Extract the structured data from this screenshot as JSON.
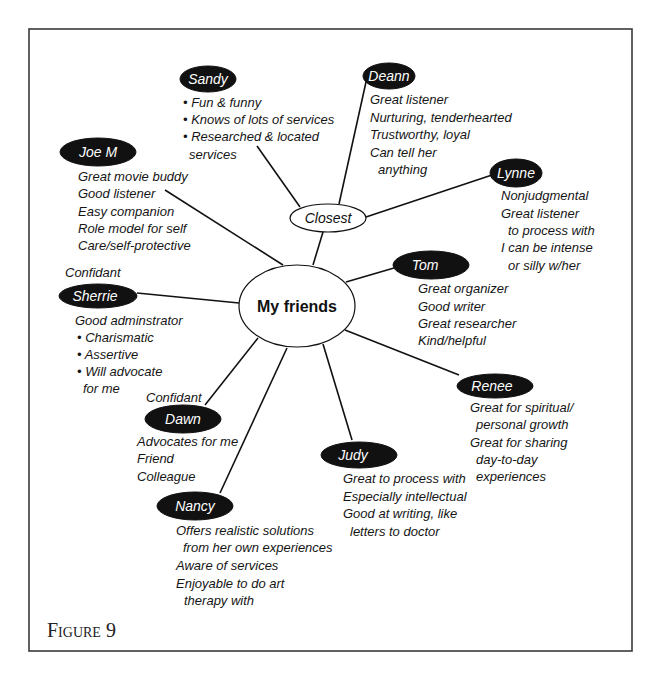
{
  "diagram": {
    "center": {
      "label": "My friends"
    },
    "hub": {
      "label": "Closest"
    },
    "caption": "Figure 9",
    "colors": {
      "node_fill": "#111111",
      "node_text": "#ffffff",
      "line": "#111111",
      "frame": "#3a3a3a"
    },
    "nodes": {
      "sandy": {
        "label": "Sandy",
        "notes": [
          "• Fun & funny",
          "• Knows of lots of services",
          "• Researched & located",
          "services"
        ]
      },
      "deann": {
        "label": "Deann",
        "notes": [
          "Great listener",
          "Nurturing, tenderhearted",
          "Trustworthy, loyal",
          "Can tell her",
          "anything"
        ]
      },
      "joe_m": {
        "label": "Joe M",
        "notes": [
          "Great movie buddy",
          "Good listener",
          "Easy companion",
          "Role model for self",
          "Care/self-protective"
        ]
      },
      "lynne": {
        "label": "Lynne",
        "notes": [
          "Nonjudgmental",
          "Great listener",
          "to process with",
          "I can be intense",
          "or silly w/her"
        ]
      },
      "tom": {
        "label": "Tom",
        "notes": [
          "Great organizer",
          "Good writer",
          "Great researcher",
          "Kind/helpful"
        ]
      },
      "sherrie": {
        "label": "Sherrie",
        "tag": "Confidant",
        "notes": [
          "Good adminstrator",
          "• Charismatic",
          "• Assertive",
          "• Will advocate",
          "for me"
        ]
      },
      "dawn": {
        "label": "Dawn",
        "tag": "Confidant",
        "notes": [
          "Advocates for me",
          "Friend",
          "Colleague"
        ]
      },
      "renee": {
        "label": "Renee",
        "notes": [
          "Great for spiritual/",
          "personal growth",
          "Great for sharing",
          "day-to-day",
          "experiences"
        ]
      },
      "judy": {
        "label": "Judy",
        "notes": [
          "Great to process with",
          "Especially intellectual",
          "Good at writing, like",
          "letters to doctor"
        ]
      },
      "nancy": {
        "label": "Nancy",
        "notes": [
          "Offers realistic solutions",
          "from her own experiences",
          "Aware of services",
          "Enjoyable to do art",
          "therapy with"
        ]
      }
    }
  }
}
